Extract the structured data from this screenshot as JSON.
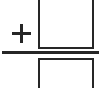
{
  "document": {
    "title": "Addition problem with blank answer boxes",
    "background_color": "#ffffff",
    "ink_color": "#262626",
    "width_px": 99,
    "height_px": 88
  },
  "expression": {
    "operator_symbol": "+",
    "operator_name": "plus",
    "layout": "vertical-column-addition",
    "rule_label": "sum-rule",
    "operands": [
      {
        "position": "top",
        "value": "",
        "placeholder": "",
        "filled": false,
        "clipped_edge": "top"
      },
      {
        "position": "bottom",
        "value": "",
        "placeholder": "",
        "filled": false,
        "clipped_edge": "bottom"
      }
    ]
  }
}
